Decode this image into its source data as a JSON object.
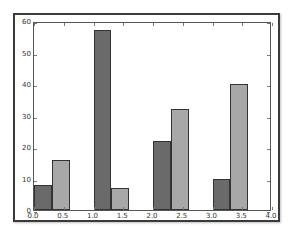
{
  "chart_data": {
    "type": "bar",
    "title": "",
    "xlabel": "",
    "ylabel": "",
    "xlim": [
      0.0,
      4.0
    ],
    "ylim": [
      0,
      60
    ],
    "grid": false,
    "legend": null,
    "bar_width": 0.3,
    "x_ticks": [
      "0.0",
      "0.5",
      "1.0",
      "1.5",
      "2.0",
      "2.5",
      "3.0",
      "3.5",
      "4.0"
    ],
    "y_ticks": [
      "0",
      "10",
      "20",
      "30",
      "40",
      "50",
      "60"
    ],
    "x": [
      0,
      1,
      2,
      3
    ],
    "series": [
      {
        "name": "series-1",
        "color": "#6a6a6a",
        "offset": 0.0,
        "values": [
          8,
          57,
          22,
          10
        ]
      },
      {
        "name": "series-2",
        "color": "#a8a8a8",
        "offset": 0.3,
        "values": [
          16,
          7,
          32,
          40
        ]
      }
    ]
  }
}
